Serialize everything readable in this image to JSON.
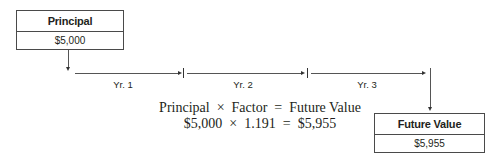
{
  "start_box": {
    "header": "Principal",
    "value": "$5,000"
  },
  "end_box": {
    "header": "Future Value",
    "value": "$5,955"
  },
  "timeline": {
    "periods": [
      {
        "label": "Yr. 1"
      },
      {
        "label": "Yr. 2"
      },
      {
        "label": "Yr. 3"
      }
    ]
  },
  "formula": {
    "line1": "Principal  ×  Factor  =  Future Value",
    "line2": "$5,000  ×  1.191  =  $5,955"
  },
  "colors": {
    "line": "#555555",
    "text": "#231f20",
    "border": "#4a4a4a"
  }
}
